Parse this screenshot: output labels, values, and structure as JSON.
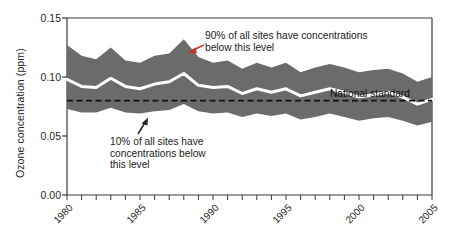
{
  "chart_data": {
    "type": "area",
    "title": "",
    "xlabel": "",
    "ylabel": "Ozone concentration (ppm)",
    "xlim": [
      1980,
      2005
    ],
    "ylim": [
      0.0,
      0.15
    ],
    "grid": false,
    "legend_position": "none",
    "y_ticks": [
      "0.15",
      "0.10",
      "0.05",
      "0.00"
    ],
    "y_tick_values": [
      0.15,
      0.1,
      0.05,
      0.0
    ],
    "x_ticks": [
      "1980",
      "1985",
      "1990",
      "1995",
      "2000",
      "2005"
    ],
    "x_tick_values": [
      1980,
      1985,
      1990,
      1995,
      2000,
      2005
    ],
    "x_minor_tick_interval": 1,
    "years": [
      1980,
      1981,
      1982,
      1983,
      1984,
      1985,
      1986,
      1987,
      1988,
      1989,
      1990,
      1991,
      1992,
      1993,
      1994,
      1995,
      1996,
      1997,
      1998,
      1999,
      2000,
      2001,
      2002,
      2003,
      2004,
      2005
    ],
    "series": [
      {
        "name": "90th percentile",
        "role": "upper-band-edge",
        "values": [
          0.127,
          0.118,
          0.115,
          0.125,
          0.114,
          0.112,
          0.118,
          0.12,
          0.132,
          0.117,
          0.112,
          0.114,
          0.107,
          0.112,
          0.108,
          0.112,
          0.104,
          0.108,
          0.111,
          0.108,
          0.104,
          0.106,
          0.107,
          0.103,
          0.096,
          0.1
        ]
      },
      {
        "name": "Median (50th percentile)",
        "role": "median-line",
        "values": [
          0.098,
          0.092,
          0.091,
          0.099,
          0.092,
          0.09,
          0.094,
          0.096,
          0.103,
          0.093,
          0.091,
          0.092,
          0.086,
          0.09,
          0.087,
          0.09,
          0.084,
          0.087,
          0.09,
          0.087,
          0.083,
          0.085,
          0.087,
          0.083,
          0.077,
          0.081
        ]
      },
      {
        "name": "10th percentile",
        "role": "lower-band-edge",
        "values": [
          0.073,
          0.07,
          0.07,
          0.074,
          0.07,
          0.069,
          0.071,
          0.072,
          0.077,
          0.071,
          0.069,
          0.07,
          0.066,
          0.069,
          0.067,
          0.069,
          0.064,
          0.066,
          0.069,
          0.066,
          0.063,
          0.065,
          0.066,
          0.063,
          0.059,
          0.062
        ]
      }
    ],
    "reference_line": {
      "label": "National standard",
      "value": 0.08,
      "style": "dashed"
    },
    "annotations": [
      {
        "id": "upper",
        "text": "90% of all sites have concentrations\nbelow this level",
        "arrow": "points-down-left",
        "arrow_color": "#c0392b"
      },
      {
        "id": "lower",
        "text": "10% of all sites have\nconcentrations below\nthis level",
        "arrow": "points-up-right",
        "arrow_color": "#2b2b2b"
      }
    ],
    "colors": {
      "band_fill": "#6b6b6b",
      "median_line": "#ffffff",
      "axis": "#3a3a3a",
      "reference_line": "#111111",
      "upper_arrow": "#c0392b",
      "background": "#ffffff"
    }
  }
}
